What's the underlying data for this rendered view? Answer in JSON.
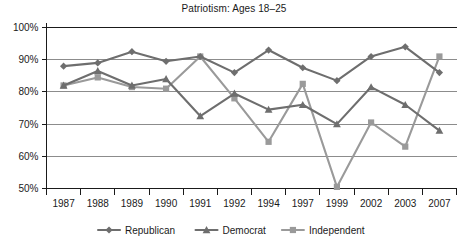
{
  "chart_data": {
    "type": "line",
    "title": "Patriotism: Ages 18–25",
    "xlabel": "",
    "ylabel": "",
    "ylim": [
      50,
      100
    ],
    "yticks": [
      50,
      60,
      70,
      80,
      90,
      100
    ],
    "ytick_labels": [
      "50%",
      "60%",
      "70%",
      "80%",
      "90%",
      "100%"
    ],
    "grid": true,
    "grid_axis": "y",
    "legend_position": "bottom",
    "categories": [
      "1987",
      "1988",
      "1989",
      "1990",
      "1991",
      "1992",
      "1994",
      "1997",
      "1999",
      "2002",
      "2003",
      "2007"
    ],
    "series": [
      {
        "name": "Republican",
        "marker": "diamond",
        "color": "#6e6e6e",
        "values": [
          88,
          89,
          92.5,
          89.5,
          91,
          86,
          93,
          87.5,
          83.5,
          91,
          94,
          86
        ]
      },
      {
        "name": "Democrat",
        "marker": "triangle",
        "color": "#6e6e6e",
        "values": [
          82,
          86.5,
          82,
          84,
          72.5,
          79.5,
          74.5,
          76,
          70,
          81.5,
          76,
          68
        ]
      },
      {
        "name": "Independent",
        "marker": "square",
        "color": "#9a9a9a",
        "values": [
          82,
          84.5,
          81.5,
          81,
          91,
          78,
          64.5,
          82.5,
          50.5,
          70.5,
          63,
          91
        ]
      }
    ]
  },
  "colors": {
    "axis": "#1a1a1a",
    "grid": "#808080",
    "republican": "#6e6e6e",
    "democrat": "#6e6e6e",
    "independent": "#9a9a9a",
    "background": "#ffffff",
    "text": "#1a1a1a"
  }
}
